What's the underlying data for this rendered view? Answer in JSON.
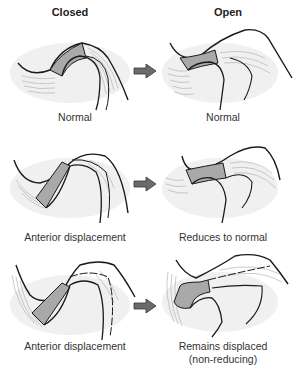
{
  "columns": {
    "closed": "Closed",
    "open": "Open"
  },
  "rows": [
    {
      "closed_label": "Normal",
      "open_label": "Normal"
    },
    {
      "closed_label": "Anterior displacement",
      "open_label": "Reduces to normal"
    },
    {
      "closed_label": "Anterior displacement",
      "open_label": "Remains displaced",
      "open_label_line2": "(non-reducing)"
    }
  ],
  "colors": {
    "disc": "#a9a9a9",
    "outline": "#1a1a1a",
    "arrow": "#6b6b6b",
    "shade": "#ececec",
    "fibers": "#9a9a9a"
  },
  "icons": {
    "transition": "right-arrow-icon"
  }
}
